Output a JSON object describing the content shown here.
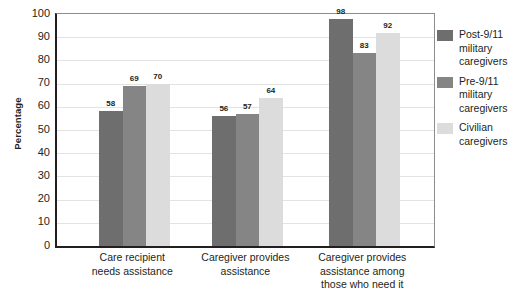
{
  "chart_data": {
    "type": "bar",
    "title": "",
    "xlabel": "",
    "ylabel": "Percentage",
    "ylim": [
      0,
      100
    ],
    "ytick_step": 10,
    "yticks": [
      100,
      90,
      80,
      70,
      60,
      50,
      40,
      30,
      20,
      10,
      0
    ],
    "grid": true,
    "legend_position": "right",
    "categories": [
      "Care recipient needs assistance",
      "Caregiver provides assistance",
      "Caregiver provides assistance among those who need it"
    ],
    "category_lines": [
      [
        "Care recipient",
        "needs assistance"
      ],
      [
        "Caregiver provides",
        "assistance"
      ],
      [
        "Caregiver provides",
        "assistance among",
        "those who need it"
      ]
    ],
    "series": [
      {
        "name": "Post-9/11 military caregivers",
        "name_lines": [
          "Post-9/11",
          "military",
          "caregivers"
        ],
        "color": "#6e6e6e",
        "values": [
          58,
          56,
          98
        ]
      },
      {
        "name": "Pre-9/11 military caregivers",
        "name_lines": [
          "Pre-9/11",
          "military",
          "caregivers"
        ],
        "color": "#858585",
        "values": [
          69,
          57,
          83
        ]
      },
      {
        "name": "Civilian caregivers",
        "name_lines": [
          "Civilian",
          "caregivers"
        ],
        "color": "#dcdcdc",
        "values": [
          70,
          64,
          92
        ]
      }
    ]
  },
  "colors": {
    "axis": "#231f20",
    "gridline": "#e3e3e3",
    "plot_border": "#8d8d8d",
    "background": "#ffffff",
    "text": "#231f20"
  }
}
